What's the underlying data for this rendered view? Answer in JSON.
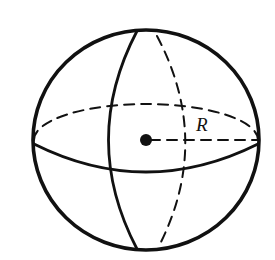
{
  "figure": {
    "labels": {
      "radius": "R"
    },
    "colors": {
      "stroke": "#111111",
      "background": "#ffffff"
    },
    "elements": [
      "outline-circle",
      "equator-front-solid",
      "equator-back-dashed",
      "meridian-front-solid",
      "meridian-back-dashed",
      "center-point",
      "radius-line-dashed"
    ]
  }
}
